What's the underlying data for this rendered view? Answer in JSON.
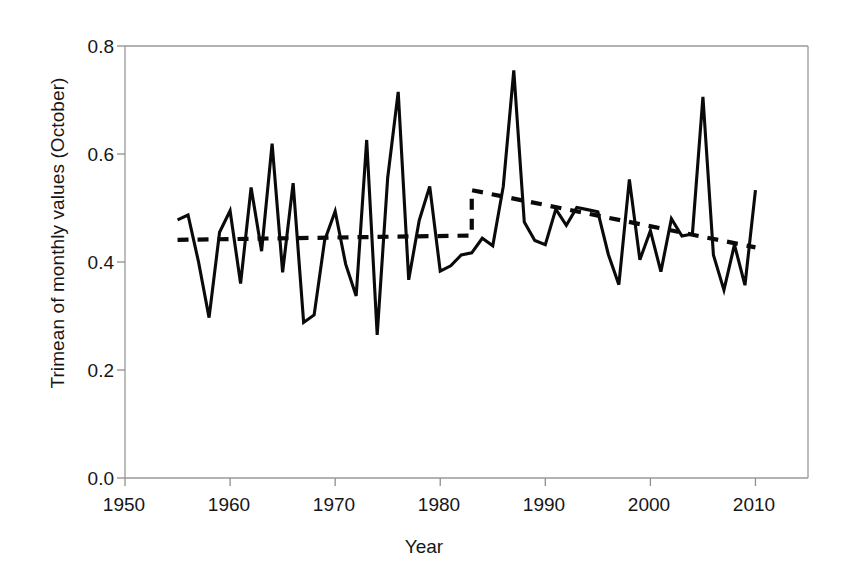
{
  "chart_data": {
    "type": "line",
    "title": "",
    "xlabel": "Year",
    "ylabel": "Trimean of monthly values (October)",
    "xlim": [
      1950,
      2015
    ],
    "ylim": [
      0.0,
      0.8
    ],
    "xticks": [
      1950,
      1960,
      1970,
      1980,
      1990,
      2000,
      2010
    ],
    "yticks": [
      "0.0",
      "0.2",
      "0.4",
      "0.6",
      "0.8"
    ],
    "ytick_values": [
      0.0,
      0.2,
      0.4,
      0.6,
      0.8
    ],
    "grid": false,
    "legend": "none",
    "series": [
      {
        "name": "Trimean of monthly values (October)",
        "style": "solid",
        "color": "#0a0a0a",
        "x": [
          1955,
          1956,
          1957,
          1958,
          1959,
          1960,
          1961,
          1962,
          1963,
          1964,
          1965,
          1966,
          1967,
          1968,
          1969,
          1970,
          1971,
          1972,
          1973,
          1974,
          1975,
          1976,
          1977,
          1978,
          1979,
          1980,
          1981,
          1982,
          1983,
          1984,
          1985,
          1986,
          1987,
          1988,
          1989,
          1990,
          1991,
          1992,
          1993,
          1994,
          1995,
          1996,
          1997,
          1998,
          1999,
          2000,
          2001,
          2002,
          2003,
          2004,
          2005,
          2006,
          2007,
          2008,
          2009,
          2010
        ],
        "values": [
          0.478,
          0.487,
          0.4,
          0.297,
          0.455,
          0.495,
          0.36,
          0.538,
          0.42,
          0.619,
          0.381,
          0.546,
          0.288,
          0.302,
          0.44,
          0.494,
          0.396,
          0.337,
          0.626,
          0.265,
          0.556,
          0.715,
          0.367,
          0.477,
          0.54,
          0.383,
          0.393,
          0.413,
          0.417,
          0.444,
          0.43,
          0.54,
          0.755,
          0.474,
          0.44,
          0.432,
          0.498,
          0.468,
          0.501,
          0.497,
          0.493,
          0.414,
          0.358,
          0.553,
          0.404,
          0.458,
          0.382,
          0.48,
          0.448,
          0.452,
          0.706,
          0.413,
          0.348,
          0.432,
          0.357,
          0.533
        ]
      },
      {
        "name": "Trend (dashed)",
        "style": "dashed",
        "color": "#0a0a0a",
        "x": [
          1955,
          1983,
          1983,
          2010
        ],
        "values": [
          0.441,
          0.449,
          0.533,
          0.427
        ]
      }
    ]
  },
  "axes": {
    "x_axis_name": "Year",
    "y_axis_name": "Trimean of monthly values (October)"
  }
}
